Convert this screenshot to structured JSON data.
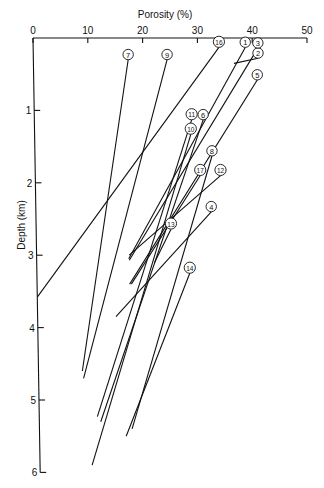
{
  "chart_data": {
    "type": "line",
    "title": "",
    "xlabel": "Porosity (%)",
    "ylabel": "Depth (km)",
    "xlim": [
      0,
      50
    ],
    "ylim": [
      6,
      0
    ],
    "x_ticks": [
      "0",
      "10",
      "20",
      "30",
      "40",
      "50"
    ],
    "y_ticks": [
      "0",
      "1",
      "2",
      "3",
      "4",
      "5",
      "6"
    ],
    "x_axis_position": "top",
    "grid": false,
    "legend": "none (numbered circle labels at top of each line)",
    "series": [
      {
        "name": "1",
        "points": [
          [
            38.7,
            0.13
          ],
          [
            16.8,
            3.05
          ]
        ]
      },
      {
        "name": "2",
        "points": [
          [
            41.0,
            0.28
          ],
          [
            36.6,
            0.35
          ]
        ]
      },
      {
        "name": "3",
        "points": [
          [
            41.0,
            0.14
          ],
          [
            16.9,
            3.07
          ]
        ]
      },
      {
        "name": "4",
        "points": [
          [
            32.0,
            2.4
          ],
          [
            14.3,
            3.85
          ]
        ]
      },
      {
        "name": "5",
        "points": [
          [
            40.8,
            0.58
          ],
          [
            16.9,
            3.4
          ]
        ]
      },
      {
        "name": "6",
        "points": [
          [
            30.8,
            1.13
          ],
          [
            11.2,
            5.3
          ]
        ]
      },
      {
        "name": "7",
        "points": [
          [
            17.3,
            0.3
          ],
          [
            8.0,
            4.6
          ]
        ]
      },
      {
        "name": "8",
        "points": [
          [
            32.3,
            1.63
          ],
          [
            16.9,
            5.4
          ]
        ]
      },
      {
        "name": "9",
        "points": [
          [
            24.4,
            0.3
          ],
          [
            8.2,
            4.7
          ]
        ]
      },
      {
        "name": "10",
        "points": [
          [
            28.5,
            1.33
          ],
          [
            9.5,
            5.9
          ]
        ]
      },
      {
        "name": "11",
        "points": [
          [
            28.7,
            1.13
          ],
          [
            10.6,
            5.23
          ]
        ]
      },
      {
        "name": "12",
        "points": [
          [
            33.8,
            1.9
          ],
          [
            16.9,
            3.0
          ]
        ]
      },
      {
        "name": "13",
        "points": [
          [
            24.6,
            2.64
          ],
          [
            21.5,
            3.1
          ]
        ]
      },
      {
        "name": "14",
        "points": [
          [
            27.9,
            3.25
          ],
          [
            15.8,
            5.5
          ]
        ]
      },
      {
        "name": "16",
        "points": [
          [
            33.9,
            0.13
          ],
          [
            0.0,
            3.58
          ]
        ]
      },
      {
        "name": "17",
        "points": [
          [
            30.1,
            1.9
          ],
          [
            17.2,
            3.4
          ]
        ]
      }
    ]
  },
  "labels": {
    "x_title": "Porosity (%)",
    "y_title": "Depth (km)"
  }
}
